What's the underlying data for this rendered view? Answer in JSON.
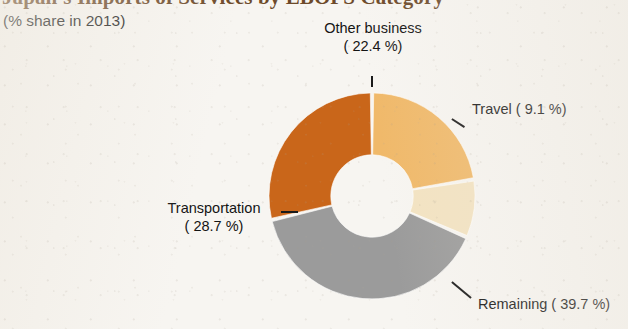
{
  "header": {
    "title": "Japan's Imports of Services by EBOPS Category",
    "subtitle": "(% share in 2013)"
  },
  "chart_data": {
    "type": "pie",
    "variant": "donut",
    "title": "Japan's Imports of Services by EBOPS Category",
    "subtitle": "(% share in 2013)",
    "unit": "% share",
    "year": "2013",
    "start_angle_deg": 0,
    "direction": "clockwise",
    "inner_radius_ratio": 0.4,
    "categories": [
      "Other business",
      "Travel",
      "Remaining",
      "Transportation"
    ],
    "values": [
      22.4,
      9.1,
      39.7,
      28.7
    ],
    "colors": [
      "#F0B96A",
      "#F3E3C2",
      "#9B9B9B",
      "#C9661A"
    ],
    "slices": [
      {
        "name": "Other business",
        "value": 22.4,
        "label_name": "Other business",
        "label_value": "( 22.4 %)",
        "color": "#F0B96A"
      },
      {
        "name": "Travel",
        "value": 9.1,
        "label_name": "Travel",
        "label_value": "( 9.1 %)",
        "color": "#F3E3C2"
      },
      {
        "name": "Remaining",
        "value": 39.7,
        "label_name": "Remaining",
        "label_value": "( 39.7 %)",
        "color": "#9B9B9B"
      },
      {
        "name": "Transportation",
        "value": 28.7,
        "label_name": "Transportation",
        "label_value": "( 28.7 %)",
        "color": "#C9661A"
      }
    ],
    "legend": "none",
    "grid": false
  }
}
